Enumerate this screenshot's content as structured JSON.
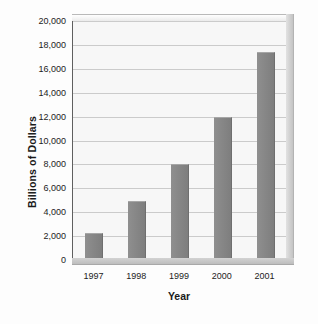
{
  "chart_data": {
    "type": "bar",
    "title": "",
    "xlabel": "Year",
    "ylabel": "Billions of Dollars",
    "categories": [
      "1997",
      "1998",
      "1999",
      "2000",
      "2001"
    ],
    "values": [
      2300,
      4900,
      8000,
      12000,
      17400
    ],
    "ylim": [
      0,
      20000
    ],
    "ytick_values": [
      0,
      2000,
      4000,
      6000,
      8000,
      10000,
      12000,
      14000,
      16000,
      18000,
      20000
    ],
    "ytick_labels": [
      "0",
      "2,000",
      "4,000",
      "6,000",
      "8,000",
      "10,000",
      "12,000",
      "14,000",
      "16,000",
      "18,000",
      "20,000"
    ],
    "grid": true,
    "legend": false,
    "series": [
      {
        "name": "Billions of Dollars",
        "values": [
          2300,
          4900,
          8000,
          12000,
          17400
        ]
      }
    ],
    "style": {
      "bar_color": "#878787",
      "plot_background": "#f7f7f7",
      "gridline_color": "#cbcbcb",
      "axis_color": "#5f5f5f",
      "text_color": "#1c1c1c",
      "three_d": true
    }
  }
}
